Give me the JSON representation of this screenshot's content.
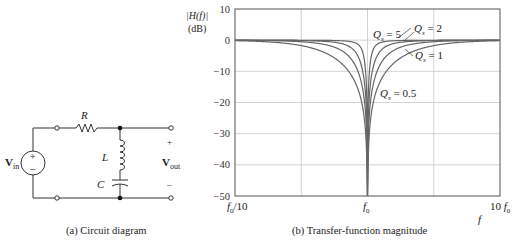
{
  "circuit": {
    "caption": "(a) Circuit diagram",
    "labels": {
      "R": "R",
      "L": "L",
      "C": "C",
      "vin": "V",
      "vin_sub": "in",
      "vout": "V",
      "vout_sub": "out",
      "plus": "+",
      "minus": "–"
    }
  },
  "plot": {
    "caption": "(b) Transfer-function magnitude",
    "ylabel_line1": "|H(f)|",
    "ylabel_line2": "(dB)",
    "xlabel": "f",
    "yticks": [
      "10",
      "0",
      "−10",
      "−20",
      "−30",
      "−40",
      "−50"
    ],
    "xticks": [
      "f0/10",
      "f0",
      "10 f0"
    ],
    "annotations": [
      "Qs = 5",
      "Qs = 2",
      "Qs = 1",
      "Qs = 0.5"
    ]
  },
  "chart_data": {
    "type": "line",
    "title": "(b) Transfer-function magnitude",
    "xlabel": "f",
    "ylabel": "|H(f)| (dB)",
    "xscale": "log",
    "xlim": [
      "f0/10",
      "10 f0"
    ],
    "ylim": [
      -50,
      10
    ],
    "yticks": [
      10,
      0,
      -10,
      -20,
      -30,
      -40,
      -50
    ],
    "xticks": [
      "f0/10",
      "f0",
      "10 f0"
    ],
    "grid": true,
    "legend": "inline annotations",
    "series": [
      {
        "name": "Qs = 5",
        "description": "narrowest notch at f0"
      },
      {
        "name": "Qs = 2",
        "description": "notch at f0"
      },
      {
        "name": "Qs = 1",
        "description": "notch at f0"
      },
      {
        "name": "Qs = 0.5",
        "description": "widest notch at f0"
      }
    ],
    "formula": "|H(f)| = |Qs(f/f0 - f0/f)| / sqrt(1 + Qs^2 (f/f0 - f0/f)^2)",
    "qs_values": [
      5,
      2,
      1,
      0.5
    ]
  }
}
